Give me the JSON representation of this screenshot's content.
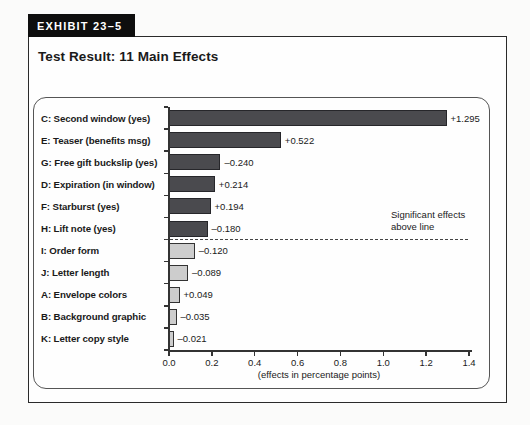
{
  "header": {
    "exhibit_label": "EXHIBIT 23–5",
    "title": "Test Result: 11 Main Effects"
  },
  "chart_data": {
    "type": "bar",
    "orientation": "horizontal",
    "title": "Test Result: 11 Main Effects",
    "xlabel": "(effects in percentage points)",
    "ylabel": "",
    "xlim": [
      0,
      1.4
    ],
    "x_ticks": [
      "0.0",
      "0.2",
      "0.4",
      "0.6",
      "0.8",
      "1.0",
      "1.2",
      "1.4"
    ],
    "grid": false,
    "legend_position": "none",
    "note": {
      "line1": "Significant effects",
      "line2": "above line"
    },
    "bars": [
      {
        "label": "C: Second window (yes)",
        "value": 1.295,
        "display": "+1.295",
        "significant": true
      },
      {
        "label": "E: Teaser (benefits msg)",
        "value": 0.522,
        "display": "+0.522",
        "significant": true
      },
      {
        "label": "G: Free gift buckslip (yes)",
        "value": -0.24,
        "display": "–0.240",
        "significant": true
      },
      {
        "label": "D: Expiration (in window)",
        "value": 0.214,
        "display": "+0.214",
        "significant": true
      },
      {
        "label": "F: Starburst (yes)",
        "value": 0.194,
        "display": "+0.194",
        "significant": true
      },
      {
        "label": "H: Lift note (yes)",
        "value": -0.18,
        "display": "–0.180",
        "significant": true
      },
      {
        "label": "I: Order form",
        "value": -0.12,
        "display": "–0.120",
        "significant": false
      },
      {
        "label": "J: Letter length",
        "value": -0.089,
        "display": "–0.089",
        "significant": false
      },
      {
        "label": "A: Envelope colors",
        "value": 0.049,
        "display": "+0.049",
        "significant": false
      },
      {
        "label": "B: Background graphic",
        "value": -0.035,
        "display": "–0.035",
        "significant": false
      },
      {
        "label": "K: Letter copy style",
        "value": -0.021,
        "display": "–0.021",
        "significant": false
      }
    ],
    "colors": {
      "significant_bar": "#4a4a4e",
      "significant_bar_border": "#26262a",
      "nonsignificant_bar": "#cdcdcd",
      "nonsignificant_bar_border": "#333333",
      "axis": "#333333"
    }
  }
}
